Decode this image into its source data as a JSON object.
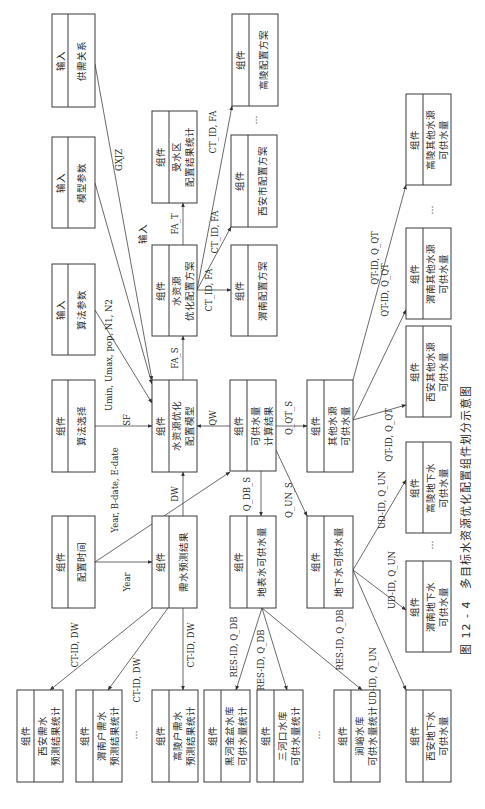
{
  "figure": {
    "caption": "图 12 - 4　多目标水资源优化配置组件划分示意图",
    "orientation": "rotated 90° clockwise"
  },
  "boxes": [
    {
      "id": "gxgx",
      "type": "输入",
      "title": [
        "供需关系"
      ],
      "x": 52,
      "y": 14,
      "w": 43,
      "h": 93
    },
    {
      "id": "mxcs",
      "type": "输入",
      "title": [
        "模型参数"
      ],
      "x": 52,
      "y": 137,
      "w": 43,
      "h": 91
    },
    {
      "id": "sfcs",
      "type": "输入",
      "title": [
        "算法参数"
      ],
      "x": 52,
      "y": 264,
      "w": 43,
      "h": 91
    },
    {
      "id": "sfxz",
      "type": "组件",
      "title": [
        "算法选择"
      ],
      "x": 52,
      "y": 380,
      "w": 43,
      "h": 92
    },
    {
      "id": "pzsj",
      "type": "组件",
      "title": [
        "配置时间"
      ],
      "x": 52,
      "y": 516,
      "w": 43,
      "h": 92
    },
    {
      "id": "sqq",
      "type": "组件",
      "title": [
        "受水区",
        "配置结果统计"
      ],
      "x": 152,
      "y": 111,
      "w": 45,
      "h": 92
    },
    {
      "id": "fa",
      "type": "组件",
      "title": [
        "水资源",
        "优化配置方案"
      ],
      "x": 152,
      "y": 245,
      "w": 45,
      "h": 91
    },
    {
      "id": "mx",
      "type": "组件",
      "title": [
        "水资源优化",
        "配置模型"
      ],
      "x": 152,
      "y": 380,
      "w": 45,
      "h": 92
    },
    {
      "id": "xs",
      "type": "组件",
      "title": [
        "需水预测结果"
      ],
      "x": 152,
      "y": 516,
      "w": 45,
      "h": 92
    },
    {
      "id": "gl_fa",
      "type": "组件",
      "title": [
        "高陵配置方案"
      ],
      "x": 232,
      "y": 14,
      "w": 46,
      "h": 92
    },
    {
      "id": "xa_fa",
      "type": "组件",
      "title": [
        "西安市配置方案"
      ],
      "x": 231,
      "y": 135,
      "w": 46,
      "h": 92
    },
    {
      "id": "wn_fa",
      "type": "组件",
      "title": [
        "渭南配置方案"
      ],
      "x": 231,
      "y": 245,
      "w": 46,
      "h": 91
    },
    {
      "id": "kgs",
      "type": "组件",
      "title": [
        "可供水量",
        "计算结果"
      ],
      "x": 230,
      "y": 380,
      "w": 46,
      "h": 91
    },
    {
      "id": "dbs",
      "type": "组件",
      "title": [
        "地表水可供水量"
      ],
      "x": 230,
      "y": 516,
      "w": 46,
      "h": 92
    },
    {
      "id": "qt",
      "type": "组件",
      "title": [
        "其他水源",
        "可供水量"
      ],
      "x": 307,
      "y": 380,
      "w": 46,
      "h": 92
    },
    {
      "id": "dxs",
      "type": "组件",
      "title": [
        "地下水可供水量"
      ],
      "x": 307,
      "y": 516,
      "w": 46,
      "h": 92
    },
    {
      "id": "gl_qt",
      "type": "组件",
      "title": [
        "高陵其他水源",
        "可供水量"
      ],
      "x": 406,
      "y": 94,
      "w": 45,
      "h": 91
    },
    {
      "id": "wn_qt",
      "type": "组件",
      "title": [
        "渭南其他水源",
        "可供水量"
      ],
      "x": 406,
      "y": 228,
      "w": 45,
      "h": 91
    },
    {
      "id": "xa_qt",
      "type": "组件",
      "title": [
        "西安其他水源",
        "可供水量"
      ],
      "x": 406,
      "y": 326,
      "w": 45,
      "h": 91
    },
    {
      "id": "gl_dx",
      "type": "组件",
      "title": [
        "高陵地下水",
        "可供水量"
      ],
      "x": 406,
      "y": 442,
      "w": 45,
      "h": 91
    },
    {
      "id": "wn_dx",
      "type": "组件",
      "title": [
        "渭南地下水",
        "可供水量"
      ],
      "x": 406,
      "y": 561,
      "w": 45,
      "h": 91
    },
    {
      "id": "xa_dx",
      "type": "组件",
      "title": [
        "西安地下水",
        "可供水量"
      ],
      "x": 406,
      "y": 690,
      "w": 45,
      "h": 92
    },
    {
      "id": "xa_xs",
      "type": "组件",
      "title": [
        "西安需水",
        "预测结果统计"
      ],
      "x": 17,
      "y": 690,
      "w": 46,
      "h": 92
    },
    {
      "id": "wn_xs",
      "type": "组件",
      "title": [
        "渭南户需水",
        "预测结果统计"
      ],
      "x": 76,
      "y": 690,
      "w": 46,
      "h": 92
    },
    {
      "id": "gl_xs",
      "type": "组件",
      "title": [
        "高陵户需水",
        "预测结果统计"
      ],
      "x": 152,
      "y": 690,
      "w": 46,
      "h": 92
    },
    {
      "id": "hh",
      "type": "组件",
      "title": [
        "黑河金盆水库",
        "可供水量统计"
      ],
      "x": 204,
      "y": 690,
      "w": 46,
      "h": 92
    },
    {
      "id": "shk",
      "type": "组件",
      "title": [
        "三河口水库",
        "可供水量统计"
      ],
      "x": 257,
      "y": 690,
      "w": 46,
      "h": 92
    },
    {
      "id": "jy",
      "type": "组件",
      "title": [
        "涧峪水库",
        "可供水量统计"
      ],
      "x": 334,
      "y": 690,
      "w": 46,
      "h": 92
    }
  ],
  "edges": [
    {
      "from": "gxgx",
      "to": "mx",
      "label": "GXJZ",
      "x1": 95,
      "y1": 64,
      "x2": 152,
      "y2": 380,
      "lx": 122,
      "ly": 160
    },
    {
      "from": "mxcs",
      "to": "mx",
      "label": "",
      "x1": 95,
      "y1": 183,
      "x2": 152,
      "y2": 384,
      "lx": 0,
      "ly": 0
    },
    {
      "from": "sfcs",
      "to": "mx",
      "label": "Umin, Umax, pop, N1, N2",
      "x1": 95,
      "y1": 310,
      "x2": 152,
      "y2": 403,
      "lx": 112,
      "ly": 355
    },
    {
      "from": "sfxz",
      "to": "mx",
      "label": "SF",
      "x1": 95,
      "y1": 426,
      "x2": 152,
      "y2": 426,
      "lx": 130,
      "ly": 420
    },
    {
      "from": "pzsj",
      "to": "xs",
      "label": "Year",
      "x1": 95,
      "y1": 562,
      "x2": 152,
      "y2": 562,
      "lx": 130,
      "ly": 582
    },
    {
      "from": "pzsj",
      "to": "kgs",
      "label": "Year, B-date, E-date",
      "x1": 95,
      "y1": 562,
      "x2": 230,
      "y2": 472,
      "lx": 118,
      "ly": 490
    },
    {
      "from": "xs",
      "to": "mx",
      "label": "DW",
      "x1": 183,
      "y1": 516,
      "x2": 183,
      "y2": 472,
      "lx": 178,
      "ly": 494
    },
    {
      "from": "kgs",
      "to": "mx",
      "label": "QW",
      "x1": 230,
      "y1": 426,
      "x2": 197,
      "y2": 426,
      "lx": 216,
      "ly": 418
    },
    {
      "from": "mx",
      "to": "fa",
      "label": "FA_S",
      "x1": 183,
      "y1": 380,
      "x2": 183,
      "y2": 336,
      "lx": 178,
      "ly": 358
    },
    {
      "from": "fa",
      "to": "sqq",
      "label": "FA_T",
      "x1": 183,
      "y1": 245,
      "x2": 183,
      "y2": 203,
      "lx": 178,
      "ly": 224
    },
    {
      "from": "fa",
      "to": "wn_fa",
      "label": "CT_ID, FA",
      "x1": 197,
      "y1": 290,
      "x2": 231,
      "y2": 290,
      "lx": 212,
      "ly": 290
    },
    {
      "from": "fa",
      "to": "xa_fa",
      "label": "CT_ID, FA",
      "x1": 197,
      "y1": 290,
      "x2": 231,
      "y2": 227,
      "lx": 218,
      "ly": 232
    },
    {
      "from": "fa",
      "to": "gl_fa",
      "label": "CT_ID, FA",
      "x1": 197,
      "y1": 290,
      "x2": 232,
      "y2": 106,
      "lx": 216,
      "ly": 132
    },
    {
      "from": "kgs",
      "to": "qt",
      "label": "Q_QT_S",
      "x1": 276,
      "y1": 426,
      "x2": 307,
      "y2": 426,
      "lx": 292,
      "ly": 418
    },
    {
      "from": "kgs",
      "to": "dbs",
      "label": "Q_DB_S",
      "x1": 261,
      "y1": 471,
      "x2": 261,
      "y2": 516,
      "lx": 250,
      "ly": 494
    },
    {
      "from": "kgs",
      "to": "dxs",
      "label": "Q_UN_S",
      "x1": 276,
      "y1": 450,
      "x2": 307,
      "y2": 516,
      "lx": 292,
      "ly": 500
    },
    {
      "from": "xs",
      "to": "xa_xs",
      "label": "CT-ID, DW",
      "x1": 152,
      "y1": 608,
      "x2": 50,
      "y2": 690,
      "lx": 78,
      "ly": 645
    },
    {
      "from": "xs",
      "to": "wn_xs",
      "label": "CT-ID, DW",
      "x1": 168,
      "y1": 608,
      "x2": 108,
      "y2": 690,
      "lx": 140,
      "ly": 680
    },
    {
      "from": "xs",
      "to": "gl_xs",
      "label": "CT-ID, DW",
      "x1": 183,
      "y1": 608,
      "x2": 183,
      "y2": 690,
      "lx": 194,
      "ly": 645
    },
    {
      "from": "dbs",
      "to": "hh",
      "label": "RES-ID, Q_DB",
      "x1": 262,
      "y1": 608,
      "x2": 236,
      "y2": 690,
      "lx": 237,
      "ly": 647
    },
    {
      "from": "dbs",
      "to": "shk",
      "label": "RES-ID, Q_DB",
      "x1": 262,
      "y1": 608,
      "x2": 287,
      "y2": 690,
      "lx": 264,
      "ly": 660
    },
    {
      "from": "dbs",
      "to": "jy",
      "label": "RES-ID, Q_DB",
      "x1": 262,
      "y1": 608,
      "x2": 362,
      "y2": 690,
      "lx": 343,
      "ly": 640
    },
    {
      "from": "dxs",
      "to": "xa_dx",
      "label": "UD-ID, Q_UN",
      "x1": 353,
      "y1": 570,
      "x2": 406,
      "y2": 690,
      "lx": 376,
      "ly": 676
    },
    {
      "from": "dxs",
      "to": "wn_dx",
      "label": "UD-ID, Q_UN",
      "x1": 353,
      "y1": 570,
      "x2": 406,
      "y2": 610,
      "lx": 395,
      "ly": 580
    },
    {
      "from": "dxs",
      "to": "gl_dx",
      "label": "UD-ID, Q_UN",
      "x1": 353,
      "y1": 570,
      "x2": 406,
      "y2": 480,
      "lx": 385,
      "ly": 500
    },
    {
      "from": "qt",
      "to": "xa_qt",
      "label": "QT-ID, Q_QT",
      "x1": 353,
      "y1": 420,
      "x2": 406,
      "y2": 405,
      "lx": 392,
      "ly": 435
    },
    {
      "from": "qt",
      "to": "wn_qt",
      "label": "QT-ID, Q_QT",
      "x1": 353,
      "y1": 420,
      "x2": 406,
      "y2": 310,
      "lx": 388,
      "ly": 290
    },
    {
      "from": "qt",
      "to": "gl_qt",
      "label": "QT-ID, Q_QT",
      "x1": 353,
      "y1": 380,
      "x2": 406,
      "y2": 185,
      "lx": 378,
      "ly": 258
    }
  ],
  "ellipses": [
    {
      "x": 257,
      "y": 120
    },
    {
      "x": 433,
      "y": 210
    },
    {
      "x": 433,
      "y": 545
    },
    {
      "x": 137,
      "y": 735
    },
    {
      "x": 320,
      "y": 735
    }
  ],
  "input_label": {
    "text": "输入",
    "x": 146,
    "y": 234
  }
}
